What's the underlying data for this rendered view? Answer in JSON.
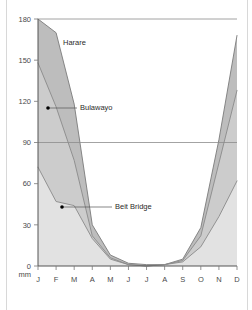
{
  "chart_data": {
    "type": "area",
    "title": "",
    "subtitle": "",
    "xlabel": "",
    "ylabel": "mm",
    "unit": "mm",
    "grid": true,
    "legend_position": "inline-annotations",
    "categories": [
      "J",
      "F",
      "M",
      "A",
      "M",
      "J",
      "J",
      "A",
      "S",
      "O",
      "N",
      "D"
    ],
    "month_names": [
      "January",
      "February",
      "March",
      "April",
      "May",
      "June",
      "July",
      "August",
      "September",
      "October",
      "November",
      "December"
    ],
    "ylim": [
      0,
      180
    ],
    "yticks": [
      0,
      30,
      60,
      90,
      120,
      150,
      180
    ],
    "ytick_labels": [
      "0",
      "30",
      "60",
      "90",
      "120",
      "150",
      "180"
    ],
    "xlim": [
      0,
      11
    ],
    "series": [
      {
        "name": "Harare",
        "color": "#bdbdbd",
        "line_color": "#7a7a7a",
        "values": [
          180,
          170,
          118,
          30,
          8,
          2,
          1,
          1,
          5,
          28,
          92,
          168
        ]
      },
      {
        "name": "Bulawayo",
        "color": "#cccccc",
        "line_color": "#8a8a8a",
        "values": [
          148,
          116,
          77,
          22,
          6,
          1,
          0,
          1,
          4,
          22,
          75,
          128
        ]
      },
      {
        "name": "Beit Bridge",
        "color": "#e2e2e2",
        "line_color": "#8a8a8a",
        "values": [
          72,
          47,
          44,
          20,
          5,
          1,
          0,
          1,
          3,
          14,
          36,
          62
        ]
      }
    ],
    "annotations": [
      {
        "label": "Harare",
        "series": "Harare",
        "text_x": 63,
        "text_y": 45,
        "leader": false,
        "dot": false
      },
      {
        "label": "Bulawayo",
        "series": "Bulawayo",
        "text_x": 80,
        "text_y": 110,
        "leader": true,
        "dot": true,
        "dot_x": 48,
        "dot_y": 108,
        "leader_x2": 77
      },
      {
        "label": "Beit Bridge",
        "series": "Beit Bridge",
        "text_x": 115,
        "text_y": 209,
        "leader": true,
        "dot": true,
        "dot_x": 62,
        "dot_y": 207,
        "leader_x2": 112
      }
    ]
  },
  "axes": {
    "y_ticks": [
      "180",
      "150",
      "120",
      "90",
      "60",
      "30",
      "0"
    ],
    "y_unit": "mm",
    "x_ticks": [
      "J",
      "F",
      "M",
      "A",
      "M",
      "J",
      "J",
      "A",
      "S",
      "O",
      "N",
      "D"
    ]
  },
  "labels": {
    "harare": "Harare",
    "bulawayo": "Bulawayo",
    "beit_bridge": "Beit Bridge"
  }
}
